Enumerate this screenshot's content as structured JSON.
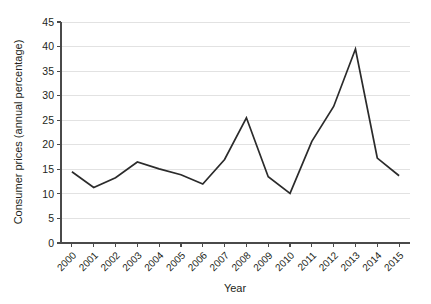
{
  "chart_data": {
    "type": "line",
    "title": "",
    "xlabel": "Year",
    "ylabel": "Consumer prices (annual percentage)",
    "categories": [
      "2000",
      "2001",
      "2002",
      "2003",
      "2004",
      "2005",
      "2006",
      "2007",
      "2008",
      "2009",
      "2010",
      "2011",
      "2012",
      "2013",
      "2014",
      "2015"
    ],
    "values": [
      14.5,
      11.3,
      13.3,
      16.5,
      15.1,
      13.9,
      12.0,
      17.0,
      25.5,
      13.5,
      10.1,
      20.7,
      27.8,
      39.5,
      17.3,
      13.7
    ],
    "series": [
      {
        "name": "Consumer prices (annual percentage)",
        "values": [
          14.5,
          11.3,
          13.3,
          16.5,
          15.1,
          13.9,
          12.0,
          17.0,
          25.5,
          13.5,
          10.1,
          20.7,
          27.8,
          39.5,
          17.3,
          13.7
        ]
      }
    ],
    "ylim": [
      0,
      45
    ],
    "yticks": [
      0,
      5,
      10,
      15,
      20,
      25,
      30,
      35,
      40,
      45
    ],
    "ytick_labels": [
      "0",
      "5",
      "10",
      "15",
      "20",
      "25",
      "30",
      "35",
      "40",
      "45"
    ],
    "xtick_labels": [
      "2000",
      "2001",
      "2002",
      "2003",
      "2004",
      "2005",
      "2006",
      "2007",
      "2008",
      "2009",
      "2010",
      "2011",
      "2012",
      "2013",
      "2014",
      "2015"
    ],
    "xtick_rotation": 45,
    "grid": "horizontal",
    "legend": "none",
    "colors": {
      "line": "#2b2b2b",
      "grid": "#e2e2e2",
      "axis": "#4a4a4a",
      "text": "#231f20",
      "background": "#ffffff"
    }
  }
}
